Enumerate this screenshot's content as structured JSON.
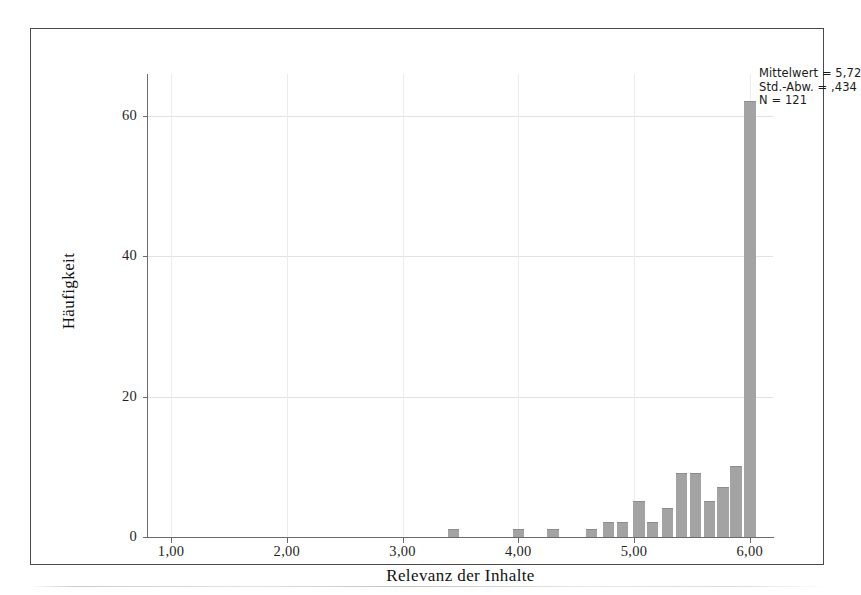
{
  "chart_data": {
    "type": "bar",
    "title": "",
    "subtitle": "",
    "xlabel": "Relevanz der Inhalte",
    "ylabel": "Häufigkeit",
    "xlim": [
      0.8,
      6.2
    ],
    "ylim": [
      0,
      66
    ],
    "xticks": [
      "1,00",
      "2,00",
      "3,00",
      "4,00",
      "5,00",
      "6,00"
    ],
    "xtick_values": [
      1.0,
      2.0,
      3.0,
      4.0,
      5.0,
      6.0
    ],
    "yticks": [
      "0",
      "20",
      "40",
      "60"
    ],
    "ytick_values": [
      0,
      20,
      40,
      60
    ],
    "grid": "horizontal-and-vertical",
    "legend": "none",
    "bin_width": 0.1,
    "bar_color": "#9a9a9a",
    "x": [
      3.44,
      4.0,
      4.3,
      4.63,
      4.78,
      4.9,
      5.04,
      5.16,
      5.29,
      5.41,
      5.53,
      5.65,
      5.77,
      5.88,
      6.0
    ],
    "values": [
      1,
      1,
      1,
      1,
      2,
      2,
      5,
      2,
      4,
      9,
      9,
      5,
      7,
      10,
      62
    ],
    "annotations": [
      "Mittelwert = 5,72",
      "Std.-Abw. = ,434",
      "N = 121"
    ]
  },
  "stats": {
    "mean_label": "Mittelwert = 5,72",
    "sd_label": "Std.-Abw. = ,434",
    "n_label": "N = 121"
  },
  "axes": {
    "x_title": "Relevanz der Inhalte",
    "y_title": "Häufigkeit"
  }
}
